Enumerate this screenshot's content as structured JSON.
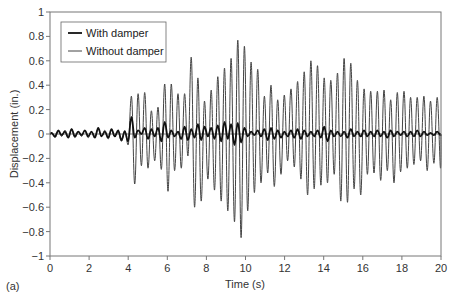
{
  "panel_label": "(a)",
  "chart_data": {
    "type": "line",
    "title": "",
    "xlabel": "Time (s)",
    "ylabel": "Displacement (in.)",
    "xlim": [
      0,
      20
    ],
    "ylim": [
      -1,
      1
    ],
    "xticks": [
      0,
      2,
      4,
      6,
      8,
      10,
      12,
      14,
      16,
      18,
      20
    ],
    "yticks": [
      1,
      0.8,
      0.6,
      0.4,
      0.2,
      0,
      -0.2,
      -0.4,
      -0.6,
      -0.8,
      -1
    ],
    "ytick_labels": [
      "1",
      "0.8",
      "0.6",
      "0.4",
      "0.2",
      "0",
      "−0.2",
      "−0.4",
      "−0.6",
      "−0.8",
      "−1"
    ],
    "grid": false,
    "legend_position": "upper-left",
    "colors": {
      "with_damper": "#111111",
      "without_damper": "#444444",
      "frame": "#777777"
    },
    "series": [
      {
        "name": "With damper",
        "line_width": 1.8,
        "half_period": 0.17,
        "start": 0.0,
        "amplitudes": [
          0.01,
          -0.02,
          0.03,
          -0.01,
          0.02,
          -0.03,
          0.04,
          -0.02,
          0.02,
          -0.01,
          0.03,
          -0.02,
          0.02,
          -0.03,
          0.05,
          -0.02,
          0.02,
          -0.03,
          0.04,
          -0.02,
          0.03,
          -0.05,
          0.02,
          -0.06,
          0.14,
          -0.03,
          0.03,
          0.0,
          0.05,
          -0.04,
          0.04,
          -0.02,
          0.05,
          -0.06,
          0.1,
          -0.03,
          0.03,
          -0.02,
          0.02,
          -0.04,
          0.06,
          -0.05,
          0.04,
          -0.03,
          0.08,
          -0.05,
          0.06,
          -0.02,
          0.05,
          -0.04,
          0.07,
          -0.06,
          0.1,
          -0.04,
          0.08,
          -0.09,
          0.09,
          -0.07,
          0.05,
          -0.02,
          0.02,
          -0.01,
          0.03,
          -0.02,
          0.04,
          -0.05,
          0.05,
          -0.04,
          0.03,
          -0.03,
          0.02,
          -0.02,
          0.03,
          -0.03,
          0.04,
          -0.04,
          0.03,
          -0.02,
          0.02,
          -0.02,
          0.03,
          -0.03,
          0.06,
          -0.06,
          0.03,
          -0.02,
          0.02,
          -0.02,
          0.02,
          -0.03,
          0.04,
          -0.02,
          0.02,
          -0.02,
          0.03,
          -0.02,
          0.02,
          -0.02,
          0.03,
          -0.02,
          0.02,
          -0.03,
          0.03,
          -0.02,
          0.02,
          -0.01,
          0.02,
          -0.02,
          0.02,
          -0.02,
          0.03,
          -0.02,
          0.02,
          -0.01,
          0.01,
          -0.01,
          0.02,
          -0.01
        ]
      },
      {
        "name": "Without damper",
        "line_width": 1.0,
        "half_period": 0.17,
        "start": 0.0,
        "amplitudes": [
          0.01,
          -0.03,
          0.02,
          -0.02,
          0.03,
          -0.02,
          0.04,
          -0.03,
          0.02,
          -0.02,
          0.03,
          -0.03,
          0.02,
          -0.02,
          0.04,
          -0.02,
          0.03,
          -0.04,
          0.03,
          -0.02,
          0.02,
          -0.06,
          0.03,
          -0.09,
          0.31,
          -0.41,
          0.33,
          -0.26,
          0.34,
          -0.28,
          0.19,
          -0.22,
          0.22,
          -0.29,
          0.41,
          -0.47,
          0.41,
          -0.3,
          0.33,
          -0.28,
          0.33,
          -0.18,
          0.63,
          -0.6,
          0.46,
          -0.55,
          0.27,
          -0.37,
          0.36,
          -0.46,
          0.47,
          -0.55,
          0.54,
          -0.63,
          0.62,
          -0.72,
          0.77,
          -0.85,
          0.72,
          -0.63,
          0.59,
          -0.48,
          0.53,
          -0.4,
          0.31,
          -0.32,
          0.4,
          -0.43,
          0.28,
          -0.33,
          0.32,
          -0.22,
          0.37,
          -0.27,
          0.43,
          -0.37,
          0.51,
          -0.5,
          0.6,
          -0.45,
          0.56,
          -0.42,
          0.46,
          -0.4,
          0.44,
          -0.33,
          0.5,
          -0.55,
          0.62,
          -0.56,
          0.58,
          -0.45,
          0.44,
          -0.5,
          0.37,
          -0.33,
          0.35,
          -0.32,
          0.35,
          -0.38,
          0.36,
          -0.3,
          0.28,
          -0.4,
          0.34,
          -0.31,
          0.35,
          -0.28,
          0.3,
          -0.25,
          0.3,
          -0.22,
          0.31,
          -0.3,
          0.27,
          -0.24,
          0.3,
          -0.28
        ]
      }
    ]
  }
}
